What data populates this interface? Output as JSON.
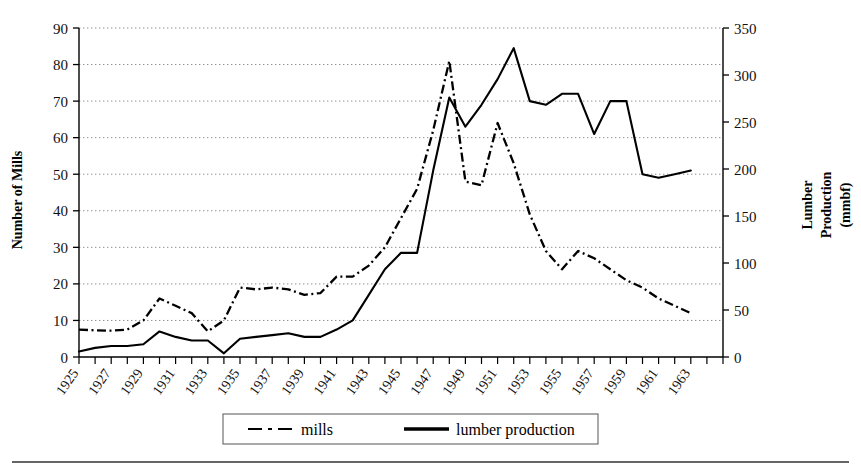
{
  "chart_data": {
    "type": "line",
    "title": "",
    "xlabel": "",
    "ylabel": "Number of Mills",
    "y2label_lines": [
      "Lumber",
      "Production",
      "(mmbf)"
    ],
    "y2label": "Lumber Production (mmbf)",
    "grid": true,
    "legend_position": "bottom",
    "xlim": [
      1925,
      1965
    ],
    "ylim": [
      0,
      90
    ],
    "y2lim": [
      0,
      350
    ],
    "yticks": [
      0,
      10,
      20,
      30,
      40,
      50,
      60,
      70,
      80,
      90
    ],
    "y2ticks": [
      0,
      50,
      100,
      150,
      200,
      250,
      300,
      350
    ],
    "xticks": [
      1925,
      1926,
      1927,
      1928,
      1929,
      1930,
      1931,
      1932,
      1933,
      1934,
      1935,
      1936,
      1937,
      1938,
      1939,
      1940,
      1941,
      1942,
      1943,
      1944,
      1945,
      1946,
      1947,
      1948,
      1949,
      1950,
      1951,
      1952,
      1953,
      1954,
      1955,
      1956,
      1957,
      1958,
      1959,
      1960,
      1961,
      1962,
      1963,
      1964,
      1965
    ],
    "xtick_labels": [
      "1925",
      "1927",
      "1929",
      "1931",
      "1933",
      "1935",
      "1937",
      "1939",
      "1941",
      "1943",
      "1945",
      "1947",
      "1949",
      "1951",
      "1953",
      "1955",
      "1957",
      "1959",
      "1961",
      "1963"
    ],
    "xtick_label_years": [
      1925,
      1927,
      1929,
      1931,
      1933,
      1935,
      1937,
      1939,
      1941,
      1943,
      1945,
      1947,
      1949,
      1951,
      1953,
      1955,
      1957,
      1959,
      1961,
      1963
    ],
    "x": [
      1925,
      1926,
      1927,
      1928,
      1929,
      1930,
      1931,
      1932,
      1933,
      1934,
      1935,
      1936,
      1937,
      1938,
      1939,
      1940,
      1941,
      1942,
      1943,
      1944,
      1945,
      1946,
      1947,
      1948,
      1949,
      1950,
      1951,
      1952,
      1953,
      1954,
      1955,
      1956,
      1957,
      1958,
      1959,
      1960,
      1961,
      1962,
      1963
    ],
    "series": [
      {
        "name": "mills",
        "axis": "left",
        "units": "number of mills",
        "style": "dash-dot",
        "color": "#000000",
        "values": [
          7.5,
          7.3,
          7.2,
          7.5,
          10,
          16,
          14,
          12,
          7,
          10,
          19,
          18.5,
          19,
          18.5,
          17,
          17.5,
          22,
          22,
          25,
          30,
          38,
          46,
          62,
          81,
          48,
          47,
          64,
          53,
          39,
          29,
          24,
          29,
          27,
          24,
          21,
          19,
          16,
          14,
          12
        ]
      },
      {
        "name": "lumber production",
        "axis": "right",
        "units": "mmbf",
        "style": "solid",
        "color": "#000000",
        "values_left_scale": [
          1.5,
          2.5,
          3,
          3,
          3.5,
          7,
          5.5,
          4.5,
          4.5,
          1,
          5,
          5.5,
          6,
          6.5,
          5.5,
          5.5,
          7.5,
          10,
          17,
          24,
          28.5,
          28.5,
          51,
          71,
          63,
          69,
          76,
          84.5,
          70,
          69,
          72,
          72,
          61,
          70,
          70,
          50,
          49,
          50,
          51
        ],
        "values": [
          5.8,
          9.7,
          11.7,
          11.7,
          13.6,
          27.2,
          21.4,
          17.5,
          17.5,
          3.9,
          19.4,
          21.4,
          23.3,
          25.3,
          21.4,
          21.4,
          29.2,
          38.9,
          66.1,
          93.3,
          110.8,
          110.8,
          198.3,
          276.1,
          245.0,
          268.3,
          295.6,
          328.6,
          272.2,
          268.3,
          280.0,
          280.0,
          237.2,
          272.2,
          272.2,
          194.4,
          190.6,
          194.4,
          198.3
        ]
      }
    ]
  },
  "legend": {
    "entries": [
      {
        "label": "mills",
        "style": "dash-dot"
      },
      {
        "label": "lumber production",
        "style": "solid"
      }
    ]
  },
  "axes": {
    "left_title": "Number of Mills",
    "right_title_line1": "Lumber",
    "right_title_line2": "Production",
    "right_title_line3": "(mmbf)"
  }
}
